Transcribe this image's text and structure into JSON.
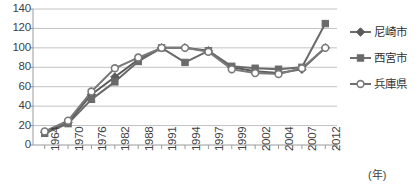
{
  "chart_data": {
    "type": "line",
    "title": "",
    "xlabel": "(年)",
    "ylabel": "",
    "ylim": [
      0,
      140
    ],
    "ytick_step": 20,
    "grid": true,
    "legend_position": "right",
    "categories": [
      "1964",
      "1970",
      "1976",
      "1982",
      "1988",
      "1991",
      "1994",
      "1997",
      "1999",
      "2002",
      "2004",
      "2007",
      "2012"
    ],
    "yticks": [
      "0",
      "20",
      "40",
      "60",
      "80",
      "100",
      "120",
      "140"
    ],
    "series": [
      {
        "name": "尼崎市",
        "marker": "diamond",
        "color": "#5a5a5a",
        "values": [
          13,
          23,
          52,
          70,
          88,
          100,
          100,
          97,
          80,
          76,
          74,
          78,
          100
        ]
      },
      {
        "name": "西宮市",
        "marker": "square",
        "color": "#6a6a6a",
        "values": [
          12,
          22,
          47,
          65,
          86,
          100,
          85,
          97,
          81,
          79,
          78,
          80,
          125
        ]
      },
      {
        "name": "兵庫県",
        "marker": "circle-open",
        "color": "#7a7a7a",
        "values": [
          14,
          25,
          55,
          79,
          90,
          100,
          100,
          96,
          78,
          74,
          73,
          79,
          100
        ]
      }
    ]
  },
  "axis": {
    "unit_label": "(年)"
  },
  "legend": {
    "items": [
      {
        "label": "尼崎市",
        "marker": "diamond"
      },
      {
        "label": "西宮市",
        "marker": "square"
      },
      {
        "label": "兵庫県",
        "marker": "circle-open"
      }
    ]
  }
}
